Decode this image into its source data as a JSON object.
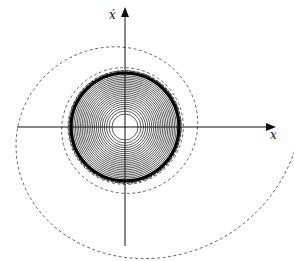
{
  "diagram": {
    "type": "phase-portrait",
    "x_axis_label": "x",
    "y_axis_label": "ẋ",
    "colors": {
      "axis": "#111111",
      "inner_trajectory": "#333333",
      "outer_trajectory": "#555555",
      "limit_cycle": "#000000"
    },
    "geometry": {
      "origin": [
        125,
        127
      ],
      "limit_cycle_radius": 54,
      "inner_hole_radius": 13,
      "inner_ring_count": 22
    }
  }
}
